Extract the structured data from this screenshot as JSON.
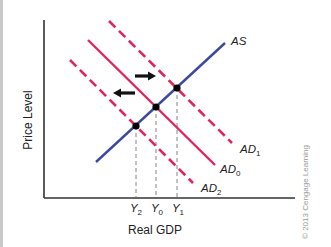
{
  "diagram": {
    "type": "AD-AS shift diagram",
    "axes": {
      "ylabel": "Price Level",
      "xlabel": "Real GDP"
    },
    "curves": {
      "as": {
        "label": "AS",
        "color": "#3b4aa0",
        "style": "solid"
      },
      "ad0": {
        "label": "AD",
        "sub": "0",
        "color": "#e0245e",
        "style": "solid"
      },
      "ad1": {
        "label": "AD",
        "sub": "1",
        "color": "#e0245e",
        "style": "dashed"
      },
      "ad2": {
        "label": "AD",
        "sub": "2",
        "color": "#e0245e",
        "style": "dashed"
      }
    },
    "x_ticks": [
      {
        "label": "Y",
        "sub": "2"
      },
      {
        "label": "Y",
        "sub": "0"
      },
      {
        "label": "Y",
        "sub": "1"
      }
    ],
    "arrows": {
      "right": "shift-right-arrow",
      "left": "shift-left-arrow"
    },
    "equilibrium_points": [
      "E2",
      "E0",
      "E1"
    ],
    "copyright": "© 2013 Cengage Learning"
  }
}
